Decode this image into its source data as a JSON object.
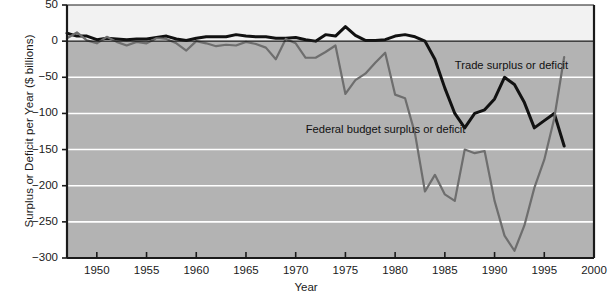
{
  "chart_data": {
    "type": "line",
    "title": "",
    "xlabel": "Year",
    "ylabel": "Surplus or Deficit per Year ($ billions)",
    "xlim": [
      1947,
      2000
    ],
    "ylim": [
      -300,
      50
    ],
    "grid": "horizontal-white-gridlines-on-gray-plot-background",
    "legend": "inline-annotations",
    "xticks": [
      1950,
      1955,
      1960,
      1965,
      1970,
      1975,
      1980,
      1985,
      1990,
      1995,
      2000
    ],
    "yticks": [
      50,
      0,
      -50,
      -100,
      -150,
      -200,
      -250,
      -300
    ],
    "series": [
      {
        "name": "Trade surplus or deficit",
        "color": "#111111",
        "label_x": 1986.0,
        "label_y": -35,
        "x": [
          1947,
          1948,
          1949,
          1950,
          1951,
          1952,
          1953,
          1954,
          1955,
          1956,
          1957,
          1958,
          1959,
          1960,
          1961,
          1962,
          1963,
          1964,
          1965,
          1966,
          1967,
          1968,
          1969,
          1970,
          1971,
          1972,
          1973,
          1974,
          1975,
          1976,
          1977,
          1978,
          1979,
          1980,
          1981,
          1982,
          1983,
          1984,
          1985,
          1986,
          1987,
          1988,
          1989,
          1990,
          1991,
          1992,
          1993,
          1994,
          1995,
          1996,
          1997
        ],
        "values": [
          11,
          7,
          7,
          2,
          4,
          3,
          2,
          3,
          3,
          5,
          7,
          3,
          1,
          4,
          6,
          6,
          6,
          9,
          7,
          6,
          6,
          4,
          4,
          5,
          2,
          0,
          9,
          7,
          20,
          8,
          1,
          1,
          2,
          7,
          9,
          6,
          0,
          -25,
          -65,
          -100,
          -120,
          -100,
          -95,
          -80,
          -50,
          -60,
          -85,
          -120,
          -110,
          -100,
          -145
        ]
      },
      {
        "name": "Federal budget surplus or deficit",
        "color": "#6e6e6e",
        "label_x": 1971.0,
        "label_y": -123,
        "x": [
          1947,
          1948,
          1949,
          1950,
          1951,
          1952,
          1953,
          1954,
          1955,
          1956,
          1957,
          1958,
          1959,
          1960,
          1961,
          1962,
          1963,
          1964,
          1965,
          1966,
          1967,
          1968,
          1969,
          1970,
          1971,
          1972,
          1973,
          1974,
          1975,
          1976,
          1977,
          1978,
          1979,
          1980,
          1981,
          1982,
          1983,
          1984,
          1985,
          1986,
          1987,
          1988,
          1989,
          1990,
          1991,
          1992,
          1993,
          1994,
          1995,
          1996,
          1997
        ],
        "values": [
          4,
          12,
          1,
          -3,
          6,
          -1,
          -6,
          -1,
          -3,
          4,
          3,
          -3,
          -13,
          0,
          -3,
          -7,
          -5,
          -6,
          -1,
          -4,
          -9,
          -25,
          3,
          -3,
          -23,
          -23,
          -15,
          -6,
          -73,
          -54,
          -45,
          -30,
          -16,
          -74,
          -79,
          -128,
          -208,
          -185,
          -212,
          -221,
          -150,
          -155,
          -152,
          -221,
          -269,
          -290,
          -255,
          -203,
          -164,
          -107,
          -22
        ]
      }
    ]
  },
  "axis": {
    "y_title": "Surplus or Deficit per Year ($ billions)",
    "x_title": "Year",
    "y_labels": [
      "50",
      "0",
      "−100",
      "−150",
      "−200",
      "−250",
      "−300",
      "−50"
    ],
    "ytick_texts": [
      "50",
      "0",
      "−50",
      "−100",
      "−150",
      "−200",
      "−250",
      "−300"
    ],
    "xtick_texts": [
      "1950",
      "1955",
      "1960",
      "1965",
      "1970",
      "1975",
      "1980",
      "1985",
      "1990",
      "1995",
      "2000"
    ]
  },
  "annotations": {
    "trade_label": "Trade surplus or deficit",
    "budget_label": "Federal budget surplus or deficit"
  },
  "colors": {
    "plot_background": "#b3b3b3",
    "figure_background": "#ffffff",
    "upper_band": "#f2f2f2",
    "gridline": "#ffffff",
    "axis": "#1a1a1a",
    "trade_series": "#111111",
    "budget_series": "#6e6e6e"
  }
}
